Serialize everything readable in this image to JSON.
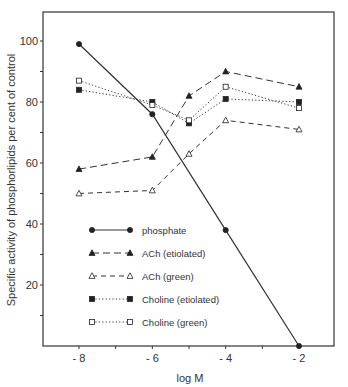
{
  "chart_data": {
    "type": "line",
    "title": "",
    "xlabel": "log M",
    "ylabel": "Specific activity of phosphorlipids per cent of control",
    "xlim": [
      -9,
      -1.3
    ],
    "ylim": [
      0,
      110
    ],
    "xticks": [
      -8,
      -6,
      -4,
      -2
    ],
    "xtick_labels": [
      "- 8",
      "- 6",
      "- 4",
      "- 2"
    ],
    "yticks": [
      20,
      40,
      60,
      80,
      100
    ],
    "ytick_labels": [
      "20",
      "40",
      "60",
      "80",
      "100"
    ],
    "grid": false,
    "legend_position": "inside-lower-left",
    "series": [
      {
        "name": "phosphate",
        "marker": "filled-circle",
        "line": "solid",
        "x": [
          -8,
          -6,
          -4,
          -2
        ],
        "values": [
          99,
          76,
          38,
          0
        ]
      },
      {
        "name": "ACh (etiolated)",
        "marker": "filled-triangle",
        "line": "long-dash",
        "x": [
          -8,
          -6,
          -5,
          -4,
          -2
        ],
        "values": [
          58,
          62,
          82,
          90,
          85
        ]
      },
      {
        "name": "ACh (green)",
        "marker": "open-triangle",
        "line": "dash",
        "x": [
          -8,
          -6,
          -5,
          -4,
          -2
        ],
        "values": [
          50,
          51,
          63,
          74,
          71
        ]
      },
      {
        "name": "Choline (etiolated)",
        "marker": "filled-square",
        "line": "dotted",
        "x": [
          -8,
          -6,
          -5,
          -4,
          -2
        ],
        "values": [
          84,
          80,
          73,
          81,
          80
        ]
      },
      {
        "name": "Choline (green)",
        "marker": "open-square",
        "line": "dotted",
        "x": [
          -8,
          -6,
          -5,
          -4,
          -2
        ],
        "values": [
          87,
          79,
          74,
          85,
          78
        ]
      }
    ]
  }
}
